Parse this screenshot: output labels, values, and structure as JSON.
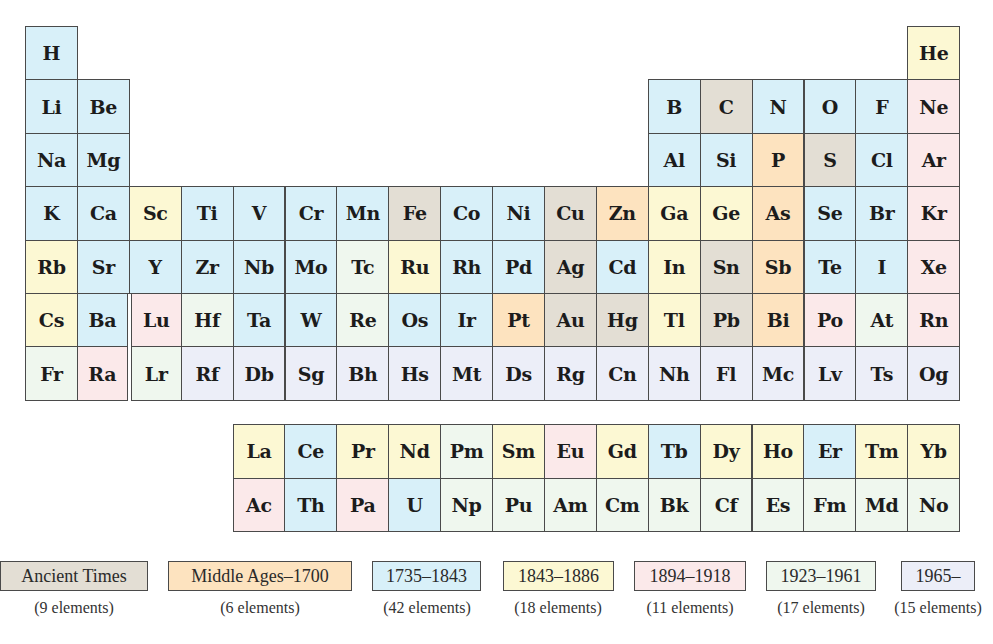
{
  "colors": {
    "ancient": "#e3ded4",
    "middle": "#fde3bf",
    "c1735": "#d8f0f9",
    "c1843": "#fcf8d3",
    "c1894": "#fbe9ea",
    "c1923": "#eff7ee",
    "c1965": "#eceef8"
  },
  "main_table": [
    [
      {
        "s": "H",
        "c": "c1735",
        "col": 1
      },
      {
        "s": "He",
        "c": "c1843",
        "col": 18
      }
    ],
    [
      {
        "s": "Li",
        "c": "c1735",
        "col": 1
      },
      {
        "s": "Be",
        "c": "c1735",
        "col": 2
      },
      {
        "s": "B",
        "c": "c1735",
        "col": 13
      },
      {
        "s": "C",
        "c": "ancient",
        "col": 14
      },
      {
        "s": "N",
        "c": "c1735",
        "col": 15
      },
      {
        "s": "O",
        "c": "c1735",
        "col": 16
      },
      {
        "s": "F",
        "c": "c1735",
        "col": 17
      },
      {
        "s": "Ne",
        "c": "c1894",
        "col": 18
      }
    ],
    [
      {
        "s": "Na",
        "c": "c1735",
        "col": 1
      },
      {
        "s": "Mg",
        "c": "c1735",
        "col": 2
      },
      {
        "s": "Al",
        "c": "c1735",
        "col": 13
      },
      {
        "s": "Si",
        "c": "c1735",
        "col": 14
      },
      {
        "s": "P",
        "c": "middle",
        "col": 15
      },
      {
        "s": "S",
        "c": "ancient",
        "col": 16
      },
      {
        "s": "Cl",
        "c": "c1735",
        "col": 17
      },
      {
        "s": "Ar",
        "c": "c1894",
        "col": 18
      }
    ],
    [
      {
        "s": "K",
        "c": "c1735",
        "col": 1
      },
      {
        "s": "Ca",
        "c": "c1735",
        "col": 2
      },
      {
        "s": "Sc",
        "c": "c1843",
        "col": 3
      },
      {
        "s": "Ti",
        "c": "c1735",
        "col": 4
      },
      {
        "s": "V",
        "c": "c1735",
        "col": 5
      },
      {
        "s": "Cr",
        "c": "c1735",
        "col": 6
      },
      {
        "s": "Mn",
        "c": "c1735",
        "col": 7
      },
      {
        "s": "Fe",
        "c": "ancient",
        "col": 8
      },
      {
        "s": "Co",
        "c": "c1735",
        "col": 9
      },
      {
        "s": "Ni",
        "c": "c1735",
        "col": 10
      },
      {
        "s": "Cu",
        "c": "ancient",
        "col": 11
      },
      {
        "s": "Zn",
        "c": "middle",
        "col": 12
      },
      {
        "s": "Ga",
        "c": "c1843",
        "col": 13
      },
      {
        "s": "Ge",
        "c": "c1843",
        "col": 14
      },
      {
        "s": "As",
        "c": "middle",
        "col": 15
      },
      {
        "s": "Se",
        "c": "c1735",
        "col": 16
      },
      {
        "s": "Br",
        "c": "c1735",
        "col": 17
      },
      {
        "s": "Kr",
        "c": "c1894",
        "col": 18
      }
    ],
    [
      {
        "s": "Rb",
        "c": "c1843",
        "col": 1
      },
      {
        "s": "Sr",
        "c": "c1735",
        "col": 2
      },
      {
        "s": "Y",
        "c": "c1735",
        "col": 3
      },
      {
        "s": "Zr",
        "c": "c1735",
        "col": 4
      },
      {
        "s": "Nb",
        "c": "c1735",
        "col": 5
      },
      {
        "s": "Mo",
        "c": "c1735",
        "col": 6
      },
      {
        "s": "Tc",
        "c": "c1923",
        "col": 7
      },
      {
        "s": "Ru",
        "c": "c1843",
        "col": 8
      },
      {
        "s": "Rh",
        "c": "c1735",
        "col": 9
      },
      {
        "s": "Pd",
        "c": "c1735",
        "col": 10
      },
      {
        "s": "Ag",
        "c": "ancient",
        "col": 11
      },
      {
        "s": "Cd",
        "c": "c1735",
        "col": 12
      },
      {
        "s": "In",
        "c": "c1843",
        "col": 13
      },
      {
        "s": "Sn",
        "c": "ancient",
        "col": 14
      },
      {
        "s": "Sb",
        "c": "middle",
        "col": 15
      },
      {
        "s": "Te",
        "c": "c1735",
        "col": 16
      },
      {
        "s": "I",
        "c": "c1735",
        "col": 17
      },
      {
        "s": "Xe",
        "c": "c1894",
        "col": 18
      }
    ],
    [
      {
        "s": "Cs",
        "c": "c1843",
        "col": 1
      },
      {
        "s": "Ba",
        "c": "c1735",
        "col": 2
      },
      {
        "s": "Lu",
        "c": "c1894",
        "col": 3
      },
      {
        "s": "Hf",
        "c": "c1923",
        "col": 4
      },
      {
        "s": "Ta",
        "c": "c1735",
        "col": 5
      },
      {
        "s": "W",
        "c": "c1735",
        "col": 6
      },
      {
        "s": "Re",
        "c": "c1923",
        "col": 7
      },
      {
        "s": "Os",
        "c": "c1735",
        "col": 8
      },
      {
        "s": "Ir",
        "c": "c1735",
        "col": 9
      },
      {
        "s": "Pt",
        "c": "middle",
        "col": 10
      },
      {
        "s": "Au",
        "c": "ancient",
        "col": 11
      },
      {
        "s": "Hg",
        "c": "ancient",
        "col": 12
      },
      {
        "s": "Tl",
        "c": "c1843",
        "col": 13
      },
      {
        "s": "Pb",
        "c": "ancient",
        "col": 14
      },
      {
        "s": "Bi",
        "c": "middle",
        "col": 15
      },
      {
        "s": "Po",
        "c": "c1894",
        "col": 16
      },
      {
        "s": "At",
        "c": "c1923",
        "col": 17
      },
      {
        "s": "Rn",
        "c": "c1894",
        "col": 18
      }
    ],
    [
      {
        "s": "Fr",
        "c": "c1923",
        "col": 1
      },
      {
        "s": "Ra",
        "c": "c1894",
        "col": 2
      },
      {
        "s": "Lr",
        "c": "c1923",
        "col": 3
      },
      {
        "s": "Rf",
        "c": "c1965",
        "col": 4
      },
      {
        "s": "Db",
        "c": "c1965",
        "col": 5
      },
      {
        "s": "Sg",
        "c": "c1965",
        "col": 6
      },
      {
        "s": "Bh",
        "c": "c1965",
        "col": 7
      },
      {
        "s": "Hs",
        "c": "c1965",
        "col": 8
      },
      {
        "s": "Mt",
        "c": "c1965",
        "col": 9
      },
      {
        "s": "Ds",
        "c": "c1965",
        "col": 10
      },
      {
        "s": "Rg",
        "c": "c1965",
        "col": 11
      },
      {
        "s": "Cn",
        "c": "c1965",
        "col": 12
      },
      {
        "s": "Nh",
        "c": "c1965",
        "col": 13
      },
      {
        "s": "Fl",
        "c": "c1965",
        "col": 14
      },
      {
        "s": "Mc",
        "c": "c1965",
        "col": 15
      },
      {
        "s": "Lv",
        "c": "c1965",
        "col": 16
      },
      {
        "s": "Ts",
        "c": "c1965",
        "col": 17
      },
      {
        "s": "Og",
        "c": "c1965",
        "col": 18
      }
    ]
  ],
  "f_block": [
    [
      {
        "s": "La",
        "c": "c1843"
      },
      {
        "s": "Ce",
        "c": "c1735"
      },
      {
        "s": "Pr",
        "c": "c1843"
      },
      {
        "s": "Nd",
        "c": "c1843"
      },
      {
        "s": "Pm",
        "c": "c1923"
      },
      {
        "s": "Sm",
        "c": "c1843"
      },
      {
        "s": "Eu",
        "c": "c1894"
      },
      {
        "s": "Gd",
        "c": "c1843"
      },
      {
        "s": "Tb",
        "c": "c1735"
      },
      {
        "s": "Dy",
        "c": "c1843"
      },
      {
        "s": "Ho",
        "c": "c1843"
      },
      {
        "s": "Er",
        "c": "c1735"
      },
      {
        "s": "Tm",
        "c": "c1843"
      },
      {
        "s": "Yb",
        "c": "c1843"
      }
    ],
    [
      {
        "s": "Ac",
        "c": "c1894"
      },
      {
        "s": "Th",
        "c": "c1735"
      },
      {
        "s": "Pa",
        "c": "c1894"
      },
      {
        "s": "U",
        "c": "c1735"
      },
      {
        "s": "Np",
        "c": "c1923"
      },
      {
        "s": "Pu",
        "c": "c1923"
      },
      {
        "s": "Am",
        "c": "c1923"
      },
      {
        "s": "Cm",
        "c": "c1923"
      },
      {
        "s": "Bk",
        "c": "c1923"
      },
      {
        "s": "Cf",
        "c": "c1923"
      },
      {
        "s": "Es",
        "c": "c1923"
      },
      {
        "s": "Fm",
        "c": "c1923"
      },
      {
        "s": "Md",
        "c": "c1923"
      },
      {
        "s": "No",
        "c": "c1923"
      }
    ]
  ],
  "legend": [
    {
      "key": "ancient",
      "label": "Ancient Times",
      "count": "(9 elements)",
      "x": 0,
      "w": 148,
      "cx": 74
    },
    {
      "key": "middle",
      "label": "Middle Ages–1700",
      "count": "(6 elements)",
      "x": 168,
      "w": 184,
      "cx": 260
    },
    {
      "key": "c1735",
      "label": "1735–1843",
      "count": "(42 elements)",
      "x": 372,
      "w": 109,
      "cx": 427
    },
    {
      "key": "c1843",
      "label": "1843–1886",
      "count": "(18 elements)",
      "x": 503,
      "w": 111,
      "cx": 558
    },
    {
      "key": "c1894",
      "label": "1894–1918",
      "count": "(11 elements)",
      "x": 634,
      "w": 112,
      "cx": 690
    },
    {
      "key": "c1923",
      "label": "1923–1961",
      "count": "(17 elements)",
      "x": 766,
      "w": 110,
      "cx": 821
    },
    {
      "key": "c1965",
      "label": "1965–",
      "count": "(15 elements)",
      "x": 901,
      "w": 74,
      "cx": 938
    }
  ],
  "chart_data": {
    "type": "table",
    "categories": [
      "Ancient Times",
      "Middle Ages–1700",
      "1735–1843",
      "1843–1886",
      "1894–1918",
      "1923–1961",
      "1965–"
    ],
    "values": [
      9,
      6,
      42,
      18,
      11,
      17,
      15
    ],
    "xlabel": "",
    "ylabel": "elements"
  }
}
